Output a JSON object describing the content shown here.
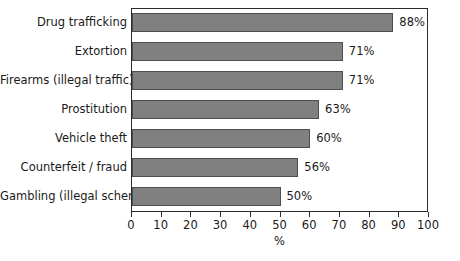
{
  "chart_data": {
    "type": "bar",
    "orientation": "horizontal",
    "title": "",
    "xlabel": "%",
    "ylabel": "",
    "categories": [
      "Drug trafficking",
      "Extortion",
      "Firearms (illegal traffic)",
      "Prostitution",
      "Vehicle theft",
      "Counterfeit / fraud",
      "Gambling (illegal schemes)"
    ],
    "values": [
      88,
      71,
      71,
      63,
      60,
      56,
      50
    ],
    "value_labels": [
      "88%",
      "71%",
      "71%",
      "63%",
      "60%",
      "56%",
      "50%"
    ],
    "xlim": [
      0,
      100
    ],
    "xticks": [
      0,
      10,
      20,
      30,
      40,
      50,
      60,
      70,
      80,
      90,
      100
    ],
    "xtick_labels": [
      "0",
      "10",
      "20",
      "30",
      "40",
      "50",
      "60",
      "70",
      "80",
      "90",
      "100"
    ],
    "grid": false,
    "legend": null,
    "colors": {
      "bar_fill": "#808080",
      "bar_edge": "#4d4d4d",
      "axis": "#2b2b2b",
      "text": "#1a1a1a",
      "background": "#ffffff"
    }
  }
}
